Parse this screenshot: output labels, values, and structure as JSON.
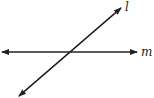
{
  "diagram": {
    "type": "intersecting-lines",
    "lines": [
      {
        "name": "l",
        "label": "l",
        "orientation": "diagonal",
        "from": [
          19,
          96
        ],
        "to": [
          121,
          8
        ]
      },
      {
        "name": "m",
        "label": "m",
        "orientation": "horizontal",
        "from": [
          2,
          52
        ],
        "to": [
          137,
          52
        ]
      }
    ],
    "intersection": [
      69,
      52
    ],
    "stroke_color": "#222222"
  }
}
